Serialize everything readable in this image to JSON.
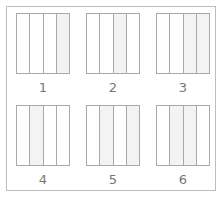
{
  "figure": {
    "panels": [
      {
        "label": "1",
        "strips": 4,
        "shaded": [
          4
        ]
      },
      {
        "label": "2",
        "strips": 4,
        "shaded": [
          3
        ]
      },
      {
        "label": "3",
        "strips": 4,
        "shaded": [
          3,
          4
        ]
      },
      {
        "label": "4",
        "strips": 4,
        "shaded": [
          2
        ]
      },
      {
        "label": "5",
        "strips": 4,
        "shaded": [
          2,
          4
        ]
      },
      {
        "label": "6",
        "strips": 4,
        "shaded": [
          2,
          3
        ]
      }
    ],
    "colors": {
      "border": "#a9a9a9",
      "frame": "#bdbdbd",
      "shade": "#f3f3f3",
      "label": "#777777"
    }
  }
}
